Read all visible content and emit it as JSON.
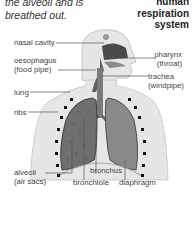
{
  "intro_text": "the alveoli and is breathed out.",
  "title": {
    "line1": "human",
    "line2": "respiration",
    "line3": "system"
  },
  "labels": {
    "nasal_cavity": "nasal cavity",
    "oesophagus": "oesophagus",
    "oesophagus_sub": "(food pipe)",
    "pharynx": "pharynx",
    "pharynx_sub": "(throat)",
    "trachea": "trachea",
    "trachea_sub": "(windpipe)",
    "lung": "lung",
    "ribs": "ribs",
    "alveoli": "alveoli",
    "alveoli_sub": "(air sacs)",
    "bronchus": "bronchus",
    "bronchiole": "bronchiole",
    "diaphragm": "diaphragm"
  },
  "colors": {
    "body_fill": "#e6e6e6",
    "lung_left": "#6f6f6f",
    "lung_right": "#8a8a8a",
    "airway": "#7a7a7a",
    "rib_marks": "#111111",
    "leader_lines": "#555555"
  }
}
